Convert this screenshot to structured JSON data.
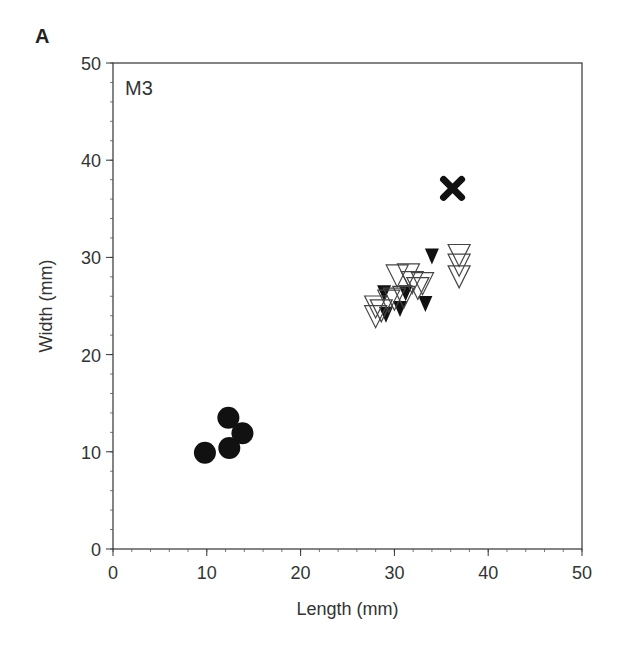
{
  "panel_label": "A",
  "chart_data": {
    "type": "scatter",
    "title": "",
    "annotation": "M3",
    "xlabel": "Length (mm)",
    "ylabel": "Width (mm)",
    "xlim": [
      0,
      50
    ],
    "ylim": [
      0,
      50
    ],
    "xticks": [
      0,
      10,
      20,
      30,
      40,
      50
    ],
    "yticks": [
      0,
      10,
      20,
      30,
      40,
      50
    ],
    "grid": false,
    "legend": null,
    "series": [
      {
        "name": "filled circles",
        "marker": "circle-filled",
        "points": [
          [
            9.8,
            9.9
          ],
          [
            12.3,
            13.5
          ],
          [
            13.8,
            11.9
          ],
          [
            12.4,
            10.4
          ]
        ]
      },
      {
        "name": "filled down-triangles",
        "marker": "triangle-down-filled",
        "points": [
          [
            28.9,
            26.3
          ],
          [
            29.1,
            24.1
          ],
          [
            30.6,
            24.7
          ],
          [
            31.2,
            26.3
          ],
          [
            33.3,
            25.2
          ],
          [
            34.0,
            30.1
          ]
        ]
      },
      {
        "name": "open down-triangles",
        "marker": "triangle-down-open",
        "points": [
          [
            28.0,
            25.0
          ],
          [
            28.6,
            24.6
          ],
          [
            29.4,
            25.6
          ],
          [
            30.3,
            28.2
          ],
          [
            31.5,
            28.3
          ],
          [
            31.9,
            27.5
          ],
          [
            32.5,
            26.9
          ],
          [
            33.0,
            27.4
          ],
          [
            28.0,
            24.0
          ],
          [
            30.0,
            25.8
          ],
          [
            31.0,
            26.0
          ],
          [
            36.9,
            30.3
          ],
          [
            36.9,
            29.3
          ],
          [
            36.9,
            28.1
          ]
        ]
      },
      {
        "name": "x marker",
        "marker": "x-filled",
        "points": [
          [
            36.2,
            37.1
          ]
        ]
      }
    ]
  }
}
